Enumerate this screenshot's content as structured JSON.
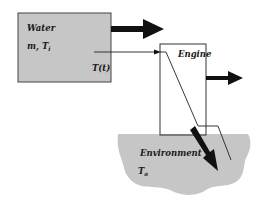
{
  "diagram": {
    "water_box": {
      "title": "Water",
      "params_main": "m, T",
      "params_sub": "i",
      "temp_label": "T(t)"
    },
    "engine_box": {
      "title": "Engine"
    },
    "environment": {
      "title": "Environment",
      "temp_main": "T",
      "temp_sub": "a"
    },
    "colors": {
      "fill_gray": "#c6c6c6",
      "stroke": "#333333",
      "arrow": "#111111"
    }
  }
}
